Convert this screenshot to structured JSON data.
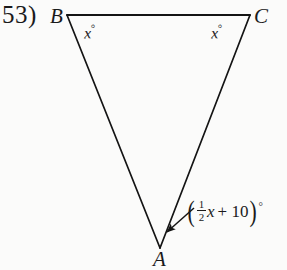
{
  "problem": {
    "number": "53)"
  },
  "figure": {
    "type": "triangle-angle-diagram",
    "vertices": [
      {
        "name": "B",
        "label": "B",
        "x": 67,
        "y": 15
      },
      {
        "name": "C",
        "label": "C",
        "x": 250,
        "y": 15
      },
      {
        "name": "A",
        "label": "A",
        "x": 160,
        "y": 246
      }
    ],
    "edges": [
      {
        "from": "B",
        "to": "C"
      },
      {
        "from": "B",
        "to": "A"
      },
      {
        "from": "C",
        "to": "A"
      }
    ],
    "angles": [
      {
        "at": "B",
        "label": "x",
        "degree_symbol": "°",
        "text": "x°"
      },
      {
        "at": "C",
        "label": "x",
        "degree_symbol": "°",
        "text": "x°"
      },
      {
        "at": "A",
        "text": "(½x + 10)°",
        "open_paren": "(",
        "fraction_numerator": "1",
        "fraction_denominator": "2",
        "variable": "x",
        "addend": "+ 10",
        "close_paren": ")",
        "degree_symbol": "°"
      }
    ],
    "leader_line": {
      "from_x": 194,
      "from_y": 208,
      "to_x": 164,
      "to_y": 234,
      "has_arrowhead": true
    },
    "stroke_color": "#141414",
    "background_color": "#fbfbfa"
  }
}
